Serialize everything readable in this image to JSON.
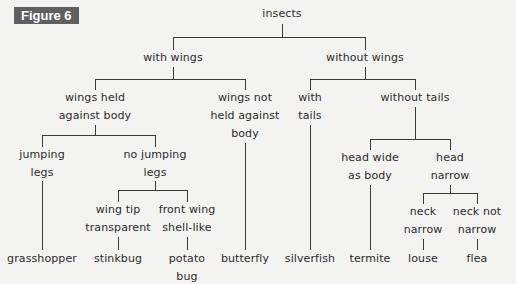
{
  "figure_label": "Figure 6",
  "nodes": {
    "root": "insects",
    "with_wings": "with wings",
    "without_wings": "without wings",
    "wings_held_l1": "wings held",
    "wings_held_l2": "against body",
    "wings_not_held_l1": "wings not",
    "wings_not_held_l2": "held against",
    "wings_not_held_l3": "body",
    "jumping_l1": "jumping",
    "jumping_l2": "legs",
    "no_jumping_l1": "no jumping",
    "no_jumping_l2": "legs",
    "wing_tip_l1": "wing tip",
    "wing_tip_l2": "transparent",
    "front_wing_l1": "front wing",
    "front_wing_l2": "shell-like",
    "with_tails_l1": "with",
    "with_tails_l2": "tails",
    "without_tails": "without tails",
    "head_wide_l1": "head wide",
    "head_wide_l2": "as body",
    "head_narrow_l1": "head",
    "head_narrow_l2": "narrow",
    "neck_narrow_l1": "neck",
    "neck_narrow_l2": "narrow",
    "neck_not_narrow_l1": "neck not",
    "neck_not_narrow_l2": "narrow"
  },
  "leaves": {
    "grasshopper": "grasshopper",
    "stinkbug": "stinkbug",
    "potato_bug_l1": "potato",
    "potato_bug_l2": "bug",
    "butterfly": "butterfly",
    "silverfish": "silverfish",
    "termite": "termite",
    "louse": "louse",
    "flea": "flea"
  },
  "colors": {
    "background": "#f3f3f1",
    "badge": "#5f5f5f",
    "line": "#3a3a3a"
  }
}
